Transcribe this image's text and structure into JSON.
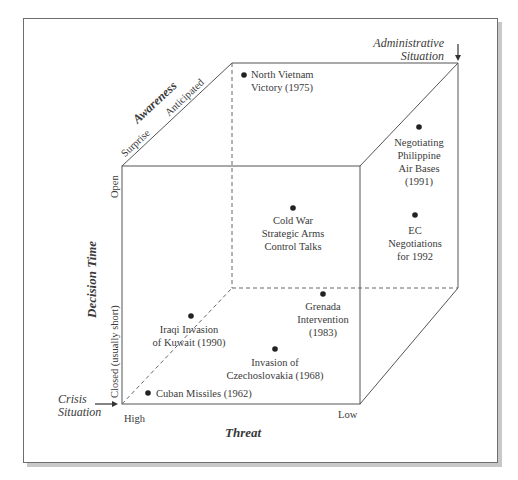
{
  "diagram": {
    "axes": {
      "threat": {
        "label": "Threat",
        "low_end": "High",
        "high_end": "Low"
      },
      "decision_time": {
        "label": "Decision Time",
        "low_end": "Closed (usually short)",
        "high_end": "Open"
      },
      "awareness": {
        "label": "Awareness",
        "low_end": "Surprise",
        "high_end": "Anticipated"
      }
    },
    "corners": {
      "crisis": {
        "line1": "Crisis",
        "line2": "Situation"
      },
      "administrative": {
        "line1": "Administrative",
        "line2": "Situation"
      }
    },
    "events": [
      {
        "id": "north-vietnam",
        "lines": [
          "North Vietnam",
          "Victory (1975)"
        ]
      },
      {
        "id": "philippine-bases",
        "lines": [
          "Negotiating",
          "Philippine",
          "Air Bases",
          "(1991)"
        ]
      },
      {
        "id": "ec-negotiations",
        "lines": [
          "EC",
          "Negotiations",
          "for 1992"
        ]
      },
      {
        "id": "cold-war",
        "lines": [
          "Cold War",
          "Strategic Arms",
          "Control Talks"
        ]
      },
      {
        "id": "grenada",
        "lines": [
          "Grenada",
          "Intervention",
          "(1983)"
        ]
      },
      {
        "id": "iraq-kuwait",
        "lines": [
          "Iraqi Invasion",
          "of Kuwait (1990)"
        ]
      },
      {
        "id": "czechoslovakia",
        "lines": [
          "Invasion of",
          "Czechoslovakia (1968)"
        ]
      },
      {
        "id": "cuban-missiles",
        "lines": [
          "Cuban Missiles (1962)"
        ]
      }
    ]
  }
}
